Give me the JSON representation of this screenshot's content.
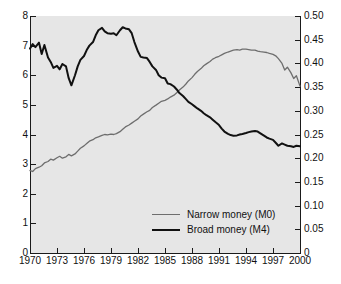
{
  "chart_data": {
    "type": "line",
    "title": "",
    "subtitle": "",
    "xlabel": "",
    "ylabel": "",
    "y2label": "",
    "grid": false,
    "legend_position": "inside-bottom-center",
    "xlim": [
      1970,
      2000
    ],
    "ylim": [
      0,
      8
    ],
    "y2lim": [
      0,
      0.5
    ],
    "xticks": [
      1970,
      1973,
      1976,
      1979,
      1982,
      1985,
      1988,
      1991,
      1994,
      1997,
      2000
    ],
    "xtick_labels": [
      "1970",
      "1973",
      "1976",
      "1979",
      "1982",
      "1985",
      "1988",
      "1991",
      "1994",
      "1997",
      "2000"
    ],
    "yticks": [
      0,
      1,
      2,
      3,
      4,
      5,
      6,
      7,
      8
    ],
    "ytick_labels": [
      "0",
      "1",
      "2",
      "3",
      "4",
      "5",
      "6",
      "7",
      "8"
    ],
    "y2ticks": [
      0,
      0.05,
      0.1,
      0.15,
      0.2,
      0.25,
      0.3,
      0.35,
      0.4,
      0.45,
      0.5
    ],
    "y2tick_labels": [
      "0",
      "0.05",
      "0.10",
      "0.15",
      "0.20",
      "0.25",
      "0.30",
      "0.35",
      "0.40",
      "0.45",
      "0.50"
    ],
    "colors": {
      "narrow_money": "#6e6e6e",
      "broad_money": "#111111",
      "plot_background": "#e6e6e6",
      "figure_background": "#ffffff",
      "axis": "#1a1a1a"
    },
    "series": [
      {
        "name": "Narrow money (M0)",
        "axis": "right",
        "color": "#6e6e6e",
        "line_width": 1.3,
        "x": [
          1970.0,
          1970.3,
          1970.6,
          1971.0,
          1971.3,
          1971.6,
          1972.0,
          1972.3,
          1972.6,
          1973.0,
          1973.3,
          1973.6,
          1974.0,
          1974.3,
          1974.6,
          1975.0,
          1975.3,
          1975.6,
          1976.0,
          1976.3,
          1976.6,
          1977.0,
          1977.3,
          1977.6,
          1978.0,
          1978.3,
          1978.6,
          1979.0,
          1979.3,
          1979.6,
          1980.0,
          1980.3,
          1980.6,
          1981.0,
          1981.3,
          1981.6,
          1982.0,
          1982.3,
          1982.6,
          1983.0,
          1983.3,
          1983.6,
          1984.0,
          1984.3,
          1984.6,
          1985.0,
          1985.3,
          1985.6,
          1986.0,
          1986.3,
          1986.6,
          1987.0,
          1987.3,
          1987.6,
          1988.0,
          1988.3,
          1988.6,
          1989.0,
          1989.3,
          1989.6,
          1990.0,
          1990.3,
          1990.6,
          1991.0,
          1991.3,
          1991.6,
          1992.0,
          1992.3,
          1992.6,
          1993.0,
          1993.3,
          1993.6,
          1994.0,
          1994.3,
          1994.6,
          1995.0,
          1995.3,
          1995.6,
          1996.0,
          1996.3,
          1996.6,
          1997.0,
          1997.3,
          1997.6,
          1998.0,
          1998.3,
          1998.6,
          1999.0,
          1999.3,
          1999.6,
          2000.0
        ],
        "values": [
          0.174,
          0.172,
          0.178,
          0.181,
          0.184,
          0.19,
          0.193,
          0.198,
          0.196,
          0.201,
          0.204,
          0.2,
          0.203,
          0.208,
          0.205,
          0.209,
          0.215,
          0.221,
          0.226,
          0.231,
          0.236,
          0.239,
          0.243,
          0.245,
          0.248,
          0.25,
          0.249,
          0.251,
          0.25,
          0.252,
          0.256,
          0.261,
          0.266,
          0.27,
          0.274,
          0.278,
          0.283,
          0.289,
          0.293,
          0.298,
          0.301,
          0.307,
          0.312,
          0.316,
          0.32,
          0.322,
          0.325,
          0.329,
          0.333,
          0.338,
          0.344,
          0.35,
          0.356,
          0.363,
          0.37,
          0.377,
          0.383,
          0.389,
          0.395,
          0.399,
          0.404,
          0.409,
          0.412,
          0.415,
          0.418,
          0.421,
          0.424,
          0.426,
          0.428,
          0.429,
          0.428,
          0.43,
          0.43,
          0.429,
          0.428,
          0.428,
          0.426,
          0.425,
          0.424,
          0.423,
          0.421,
          0.419,
          0.416,
          0.41,
          0.4,
          0.386,
          0.392,
          0.38,
          0.368,
          0.374,
          0.352
        ]
      },
      {
        "name": "Broad money (M4)",
        "axis": "left",
        "color": "#111111",
        "line_width": 2.0,
        "x": [
          1970.0,
          1970.3,
          1970.6,
          1971.0,
          1971.3,
          1971.6,
          1972.0,
          1972.3,
          1972.6,
          1973.0,
          1973.3,
          1973.6,
          1974.0,
          1974.3,
          1974.6,
          1975.0,
          1975.3,
          1975.6,
          1976.0,
          1976.3,
          1976.6,
          1977.0,
          1977.3,
          1977.6,
          1978.0,
          1978.3,
          1978.6,
          1979.0,
          1979.3,
          1979.6,
          1980.0,
          1980.3,
          1980.6,
          1981.0,
          1981.3,
          1981.6,
          1982.0,
          1982.3,
          1982.6,
          1983.0,
          1983.3,
          1983.6,
          1984.0,
          1984.3,
          1984.6,
          1985.0,
          1985.3,
          1985.6,
          1986.0,
          1986.3,
          1986.6,
          1987.0,
          1987.3,
          1987.6,
          1988.0,
          1988.3,
          1988.6,
          1989.0,
          1989.3,
          1989.6,
          1990.0,
          1990.3,
          1990.6,
          1991.0,
          1991.3,
          1991.6,
          1992.0,
          1992.3,
          1992.6,
          1993.0,
          1993.3,
          1993.6,
          1994.0,
          1994.3,
          1994.6,
          1995.0,
          1995.3,
          1995.6,
          1996.0,
          1996.3,
          1996.6,
          1997.0,
          1997.3,
          1997.6,
          1998.0,
          1998.3,
          1998.6,
          1999.0,
          1999.3,
          1999.6,
          2000.0
        ],
        "values": [
          6.9,
          7.05,
          6.95,
          7.1,
          6.72,
          7.02,
          6.6,
          6.45,
          6.25,
          6.32,
          6.2,
          6.38,
          6.3,
          5.9,
          5.66,
          6.0,
          6.3,
          6.52,
          6.65,
          6.85,
          7.0,
          7.12,
          7.35,
          7.52,
          7.6,
          7.48,
          7.42,
          7.4,
          7.42,
          7.35,
          7.52,
          7.62,
          7.58,
          7.55,
          7.42,
          7.12,
          6.8,
          6.62,
          6.6,
          6.58,
          6.45,
          6.3,
          6.18,
          6.0,
          5.92,
          5.9,
          5.72,
          5.7,
          5.62,
          5.52,
          5.4,
          5.3,
          5.2,
          5.1,
          5.02,
          4.95,
          4.88,
          4.8,
          4.72,
          4.65,
          4.58,
          4.5,
          4.42,
          4.32,
          4.2,
          4.1,
          4.02,
          3.98,
          3.96,
          3.97,
          4.0,
          4.02,
          4.05,
          4.08,
          4.1,
          4.12,
          4.1,
          4.04,
          3.96,
          3.9,
          3.86,
          3.82,
          3.72,
          3.62,
          3.7,
          3.66,
          3.62,
          3.6,
          3.58,
          3.62,
          3.6
        ]
      }
    ]
  },
  "legend": {
    "items": [
      {
        "label": "Narrow money (M0)",
        "style": "narrow"
      },
      {
        "label": "Broad money (M4)",
        "style": "broad"
      }
    ]
  }
}
